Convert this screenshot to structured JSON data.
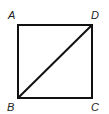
{
  "diagram": {
    "type": "geometry-square-with-diagonal",
    "stroke_color": "#111111",
    "background": "#ffffff",
    "vertices": [
      {
        "label": "A",
        "position": "top-left"
      },
      {
        "label": "D",
        "position": "top-right"
      },
      {
        "label": "B",
        "position": "bottom-left"
      },
      {
        "label": "C",
        "position": "bottom-right"
      }
    ],
    "segments": [
      {
        "from": "A",
        "to": "D",
        "kind": "side"
      },
      {
        "from": "D",
        "to": "C",
        "kind": "side"
      },
      {
        "from": "C",
        "to": "B",
        "kind": "side"
      },
      {
        "from": "B",
        "to": "A",
        "kind": "side"
      },
      {
        "from": "B",
        "to": "D",
        "kind": "diagonal"
      }
    ]
  }
}
